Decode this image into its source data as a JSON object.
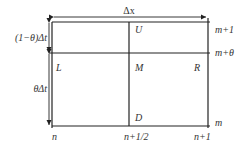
{
  "diagram": {
    "type": "finite-difference-grid",
    "colors": {
      "line": "#222222",
      "text": "#333333",
      "background": "#ffffff"
    },
    "top_dimension": {
      "label": "Δx"
    },
    "left_dimensions": [
      {
        "label": "(1−θ)Δt",
        "span": "m+θ to m+1"
      },
      {
        "label": "θΔt",
        "span": "m to m+θ"
      }
    ],
    "right_labels": [
      {
        "label": "m+1"
      },
      {
        "label": "m+θ"
      },
      {
        "label": "m"
      }
    ],
    "bottom_labels": [
      {
        "label": "n"
      },
      {
        "label": "n+1/2"
      },
      {
        "label": "n+1"
      }
    ],
    "nodes": [
      {
        "label": "U",
        "position": "upper-middle"
      },
      {
        "label": "L",
        "position": "left"
      },
      {
        "label": "M",
        "position": "center"
      },
      {
        "label": "R",
        "position": "right"
      },
      {
        "label": "D",
        "position": "lower-middle"
      }
    ]
  }
}
